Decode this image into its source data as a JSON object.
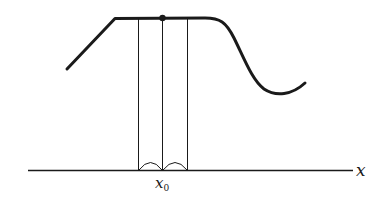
{
  "diagram": {
    "axis_label": "x",
    "point_label_base": "x",
    "point_label_sub": "0",
    "colors": {
      "stroke": "#1a1a1a",
      "background": "#ffffff"
    }
  }
}
